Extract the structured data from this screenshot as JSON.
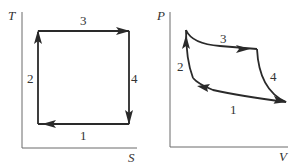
{
  "diagrams": [
    {
      "name": "T-S diagram",
      "y_axis_label": "T",
      "x_axis_label": "S",
      "shape": "rectangle",
      "segments": [
        {
          "label": "1",
          "direction": "right-to-left",
          "position": "bottom"
        },
        {
          "label": "2",
          "direction": "upward",
          "position": "left"
        },
        {
          "label": "3",
          "direction": "left-to-right",
          "position": "top"
        },
        {
          "label": "4",
          "direction": "downward",
          "position": "right"
        }
      ]
    },
    {
      "name": "P-V diagram",
      "y_axis_label": "P",
      "x_axis_label": "V",
      "shape": "curved cycle",
      "segments": [
        {
          "label": "1",
          "direction": "right-to-left",
          "position": "bottom curve"
        },
        {
          "label": "2",
          "direction": "upward",
          "position": "left curve"
        },
        {
          "label": "3",
          "direction": "left-to-right",
          "position": "top curve"
        },
        {
          "label": "4",
          "direction": "downward",
          "position": "right curve"
        }
      ]
    }
  ],
  "colors": {
    "line": "#2a2a2a",
    "axis": "#6a6a6a",
    "background": "#ffffff"
  }
}
